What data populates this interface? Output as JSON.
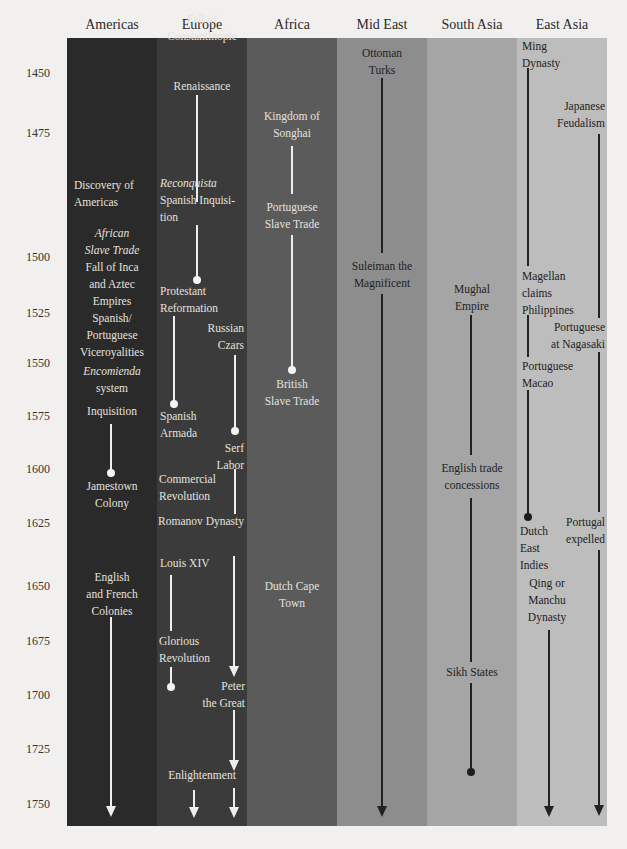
{
  "columns": [
    {
      "name": "Americas",
      "color": "#2a2a2a"
    },
    {
      "name": "Europe",
      "color": "#3b3b3b"
    },
    {
      "name": "Africa",
      "color": "#5b5b5b"
    },
    {
      "name": "Mid East",
      "color": "#8d8d8d"
    },
    {
      "name": "South Asia",
      "color": "#a5a5a5"
    },
    {
      "name": "East Asia",
      "color": "#bdbdbd"
    }
  ],
  "years": [
    "1450",
    "1475",
    "1500",
    "1525",
    "1550",
    "1575",
    "1600",
    "1625",
    "1650",
    "1675",
    "1700",
    "1725",
    "1750"
  ],
  "events": {
    "americas": {
      "discovery": [
        "Discovery of",
        "Americas"
      ],
      "african_slave": [
        "African",
        "Slave Trade"
      ],
      "fall_inca": [
        "Fall of Inca",
        "and Aztec",
        "Empires"
      ],
      "viceroyalities": [
        "Spanish/",
        "Portuguese",
        "Viceroyalities"
      ],
      "encomienda": [
        "Encomienda",
        "system"
      ],
      "inquisition": "Inquisition",
      "jamestown": [
        "Jamestown",
        "Colony"
      ],
      "colonies": [
        "English",
        "and French",
        "Colonies"
      ]
    },
    "europe": {
      "constantinople": [
        "Fall of",
        "Constantinople"
      ],
      "renaissance": "Renaissance",
      "reconquista": "Reconquista",
      "spanish_inquisition": [
        "Spanish Inquisi-",
        "tion"
      ],
      "protestant": [
        "Protestant",
        "Reformation"
      ],
      "russian_czars": [
        "Russian",
        "Czars"
      ],
      "armada": [
        "Spanish",
        "Armada"
      ],
      "serf": [
        "Serf",
        "Labor"
      ],
      "commercial": [
        "Commercial",
        "Revolution"
      ],
      "romanov": "Romanov Dynasty",
      "louis": "Louis XIV",
      "glorious": [
        "Glorious",
        "Revolution"
      ],
      "peter": [
        "Peter",
        "the Great"
      ],
      "enlightenment": "Enlightenment"
    },
    "africa": {
      "songhai": [
        "Kingdom of",
        "Songhai"
      ],
      "portuguese_slave": [
        "Portuguese",
        "Slave Trade"
      ],
      "british_slave": [
        "British",
        "Slave Trade"
      ],
      "dutch_cape": [
        "Dutch Cape",
        "Town"
      ]
    },
    "mid_east": {
      "ottoman": [
        "Ottoman",
        "Turks"
      ],
      "suleiman": [
        "Suleiman the",
        "Magnificent"
      ]
    },
    "south_asia": {
      "mughal": [
        "Mughal",
        "Empire"
      ],
      "english_trade": [
        "English trade",
        "concessions"
      ],
      "sikh": "Sikh States"
    },
    "east_asia": {
      "ming": [
        "Ming",
        "Dynasty"
      ],
      "japanese": [
        "Japanese",
        "Feudalism"
      ],
      "magellan": [
        "Magellan",
        "claims",
        "Philippines"
      ],
      "nagasaki": [
        "Portuguese",
        "at Nagasaki"
      ],
      "macao": [
        "Portuguese",
        "Macao"
      ],
      "dutch_east": [
        "Dutch",
        "East",
        "Indies"
      ],
      "portugal_expelled": [
        "Portugal",
        "expelled"
      ],
      "qing": [
        "Qing or",
        "Manchu",
        "Dynasty"
      ]
    }
  }
}
